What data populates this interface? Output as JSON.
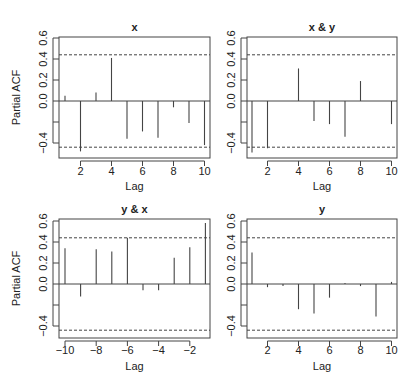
{
  "chart_data": [
    {
      "type": "bar",
      "subtype": "partial-acf",
      "title": "x",
      "xlabel": "Lag",
      "ylabel": "Partial ACF",
      "x": [
        1,
        2,
        3,
        4,
        5,
        6,
        7,
        8,
        9,
        10
      ],
      "values": [
        0.05,
        -0.48,
        0.08,
        0.41,
        -0.36,
        -0.29,
        -0.35,
        -0.06,
        -0.21,
        -0.42
      ],
      "x_ticks": [
        2,
        4,
        6,
        8,
        10
      ],
      "y_ticks": [
        "-0.4",
        "",
        "0.0",
        "0.2",
        "0.4",
        "0.6"
      ],
      "conf_limit": 0.44,
      "ylim": [
        -0.52,
        0.62
      ]
    },
    {
      "type": "bar",
      "subtype": "partial-acf",
      "title": "x & y",
      "xlabel": "Lag",
      "ylabel": "",
      "x": [
        1,
        2,
        3,
        4,
        5,
        6,
        7,
        8,
        9,
        10
      ],
      "values": [
        -0.49,
        -0.45,
        0.0,
        0.31,
        -0.19,
        -0.22,
        -0.34,
        0.19,
        0.0,
        -0.22
      ],
      "x_ticks": [
        2,
        4,
        6,
        8,
        10
      ],
      "y_ticks": [
        "-0.4",
        "",
        "0.0",
        "0.2",
        "0.4",
        "0.6"
      ],
      "conf_limit": 0.44,
      "ylim": [
        -0.52,
        0.62
      ]
    },
    {
      "type": "bar",
      "subtype": "partial-acf",
      "title": "y & x",
      "xlabel": "Lag",
      "ylabel": "Partial ACF",
      "x": [
        -10,
        -9,
        -8,
        -7,
        -6,
        -5,
        -4,
        -3,
        -2,
        -1
      ],
      "values": [
        0.34,
        -0.12,
        0.33,
        0.31,
        0.44,
        -0.06,
        -0.06,
        0.25,
        0.35,
        0.58
      ],
      "x_ticks": [
        -10,
        -8,
        -6,
        -4,
        -2
      ],
      "y_ticks": [
        "-0.4",
        "",
        "0.0",
        "0.2",
        "0.4",
        "0.6"
      ],
      "conf_limit": 0.44,
      "ylim": [
        -0.52,
        0.62
      ]
    },
    {
      "type": "bar",
      "subtype": "partial-acf",
      "title": "y",
      "xlabel": "Lag",
      "ylabel": "",
      "x": [
        1,
        2,
        3,
        4,
        5,
        6,
        7,
        8,
        9,
        10
      ],
      "values": [
        0.3,
        -0.03,
        -0.02,
        -0.24,
        -0.28,
        -0.13,
        0.01,
        -0.02,
        -0.31,
        0.02
      ],
      "x_ticks": [
        2,
        4,
        6,
        8,
        10
      ],
      "y_ticks": [
        "-0.4",
        "",
        "0.0",
        "0.2",
        "0.4",
        "0.6"
      ],
      "conf_limit": 0.44,
      "ylim": [
        -0.52,
        0.62
      ]
    }
  ],
  "panels": [
    {
      "title": "x",
      "xlabel": "Lag",
      "ylabel": "Partial ACF"
    },
    {
      "title": "x & y",
      "xlabel": "Lag",
      "ylabel": ""
    },
    {
      "title": "y & x",
      "xlabel": "Lag",
      "ylabel": "Partial ACF"
    },
    {
      "title": "y",
      "xlabel": "Lag",
      "ylabel": ""
    }
  ]
}
